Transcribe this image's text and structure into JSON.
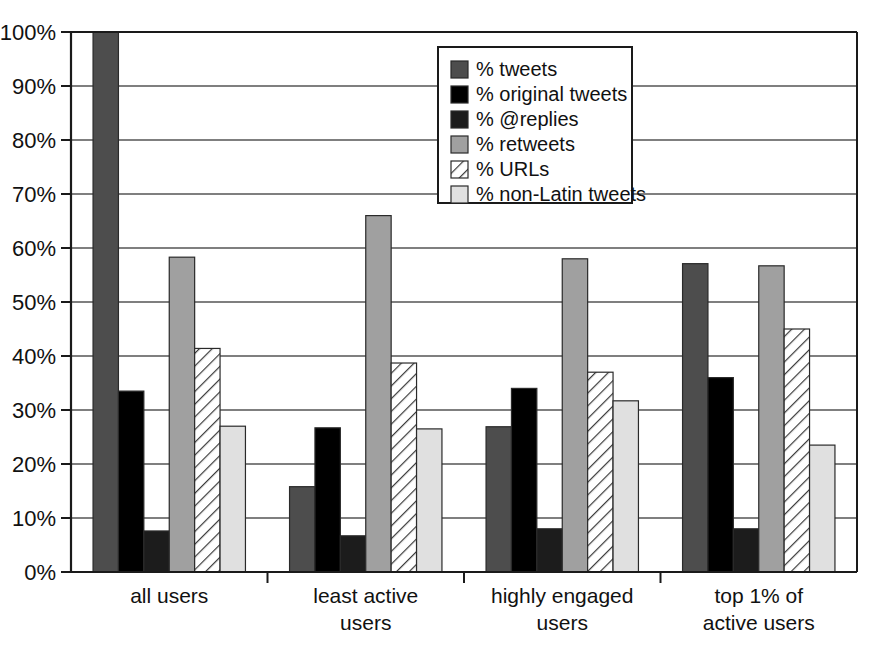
{
  "chart_data": {
    "type": "bar",
    "title": "",
    "xlabel": "",
    "ylabel": "",
    "ylim": [
      0,
      100
    ],
    "grid": true,
    "legend_position": "top-center",
    "categories": [
      "all users",
      "least active users",
      "highly engaged users",
      "top 1% of active users"
    ],
    "category_lines": [
      [
        "all users"
      ],
      [
        "least active",
        "users"
      ],
      [
        "highly engaged",
        "users"
      ],
      [
        "top 1% of",
        "active users"
      ]
    ],
    "ytick_labels": [
      "100%",
      "90%",
      "80%",
      "70%",
      "60%",
      "50%",
      "40%",
      "30%",
      "20%",
      "10%",
      "0%"
    ],
    "ytick_values": [
      100,
      90,
      80,
      70,
      60,
      50,
      40,
      30,
      20,
      10,
      0
    ],
    "series": [
      {
        "name": "% tweets",
        "fill": "#4d4d4d",
        "pattern": "solid",
        "values": [
          100,
          15.8,
          26.9,
          57.1
        ]
      },
      {
        "name": "% original tweets",
        "fill": "#000000",
        "pattern": "solid",
        "values": [
          33.5,
          26.7,
          34.0,
          36.0
        ]
      },
      {
        "name": "% @replies",
        "fill": "#1c1c1c",
        "pattern": "solid",
        "values": [
          7.6,
          6.7,
          8.0,
          8.0
        ]
      },
      {
        "name": "% retweets",
        "fill": "#a0a0a0",
        "pattern": "solid",
        "values": [
          58.3,
          66.0,
          58.0,
          56.7
        ]
      },
      {
        "name": "% URLs",
        "fill": "#ffffff",
        "pattern": "diagonal-hatch",
        "values": [
          41.4,
          38.7,
          37.0,
          45.0
        ]
      },
      {
        "name": "% non-Latin tweets",
        "fill": "#e0e0e0",
        "pattern": "solid",
        "values": [
          27.0,
          26.5,
          31.7,
          23.5
        ]
      }
    ]
  },
  "legend": {
    "entries": [
      "% tweets",
      "% original tweets",
      "% @replies",
      "% retweets",
      "% URLs",
      "% non-Latin tweets"
    ]
  },
  "colors": {
    "tweets": "#4d4d4d",
    "original_tweets": "#000000",
    "replies": "#1c1c1c",
    "retweets": "#a0a0a0",
    "urls": "#ffffff",
    "non_latin": "#e0e0e0",
    "axis": "#1a1a1a",
    "grid": "#555555",
    "background": "#ffffff"
  }
}
